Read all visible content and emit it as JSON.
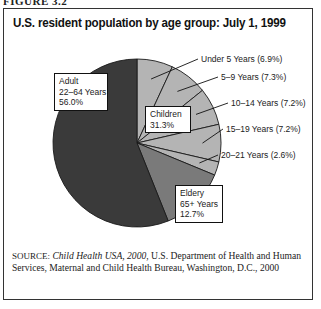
{
  "figure_label": "FIGURE 3.2",
  "chart_data": {
    "type": "pie",
    "title": "U.S. resident population by age group: July 1, 1999",
    "slices": [
      {
        "name": "Under 5 Years",
        "label": "Under 5 Years (6.9%)",
        "value": 6.9,
        "group": "Children",
        "color": "#b4b4b4"
      },
      {
        "name": "5–9 Years",
        "label": "5–9 Years (7.3%)",
        "value": 7.3,
        "group": "Children",
        "color": "#b4b4b4"
      },
      {
        "name": "10–14 Years",
        "label": "10–14 Years (7.2%)",
        "value": 7.2,
        "group": "Children",
        "color": "#b4b4b4"
      },
      {
        "name": "15–19 Years",
        "label": "15–19 Years (7.2%)",
        "value": 7.2,
        "group": "Children",
        "color": "#b4b4b4"
      },
      {
        "name": "20–21 Years",
        "label": "20–21 Years (2.6%)",
        "value": 2.6,
        "group": "Children",
        "color": "#b4b4b4"
      },
      {
        "name": "Elderly 65+ Years",
        "label": "",
        "value": 12.7,
        "group": "Elderly",
        "color": "#7a7a7a"
      },
      {
        "name": "Adult 22–64 Years",
        "label": "",
        "value": 56.0,
        "group": "Adult",
        "color": "#3a3a3a"
      }
    ],
    "group_boxes": {
      "adult": [
        "Adult",
        "22–64 Years",
        "56.0%"
      ],
      "children": [
        "Children",
        "31.3%"
      ],
      "elderly": [
        "Eldery",
        "65+ Years",
        "12.7%"
      ]
    },
    "start_angle": "12 o'clock",
    "direction": "clockwise"
  },
  "source": {
    "prefix": "SOURCE:",
    "italic": "Child Health USA, 2000",
    "rest": ", U.S. Department of Health and Human Services, Maternal and Child Health Bureau, Washington, D.C., 2000"
  }
}
